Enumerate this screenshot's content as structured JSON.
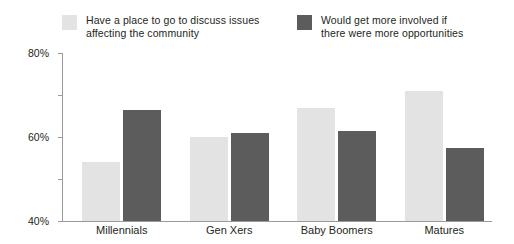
{
  "chart_data": {
    "type": "bar",
    "title": "",
    "xlabel": "",
    "ylabel": "",
    "categories": [
      "Millennials",
      "Gen Xers",
      "Baby Boomers",
      "Matures"
    ],
    "series": [
      {
        "name": "Have a place to go to discuss issues affecting the community",
        "color": "#e3e3e3",
        "values": [
          28,
          40,
          54,
          62
        ]
      },
      {
        "name": "Would get more involved if there were more opportunities",
        "color": "#5c5c5c",
        "values": [
          53,
          42,
          43,
          35
        ]
      }
    ],
    "ylim": [
      0,
      80
    ],
    "ytick_values": [
      0,
      20,
      40,
      60,
      80
    ],
    "ytick_labels": [
      "0%",
      "20%",
      "40%",
      "60%",
      "80%"
    ],
    "grid": false,
    "legend_position": "top"
  },
  "legend": {
    "entries": [
      {
        "label": "Have a place to go to discuss issues\naffecting the community",
        "color": "#e3e3e3"
      },
      {
        "label": "Would get more involved if\nthere were more opportunities",
        "color": "#5c5c5c"
      }
    ]
  },
  "axis": {
    "y_labels": [
      "80%",
      "60%",
      "40%",
      "20%",
      "0%"
    ]
  },
  "colors": {
    "series_light": "#e3e3e3",
    "series_dark": "#5c5c5c",
    "axis": "#9a9a9a",
    "text": "#231f20",
    "background": "#ffffff"
  }
}
